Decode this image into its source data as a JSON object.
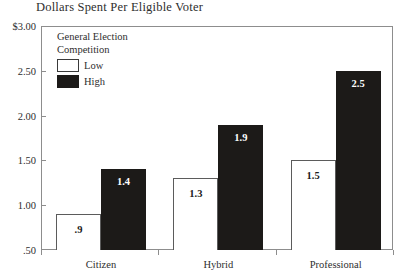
{
  "chart_data": {
    "type": "bar",
    "title": "Dollars Spent Per Eligible Voter",
    "xlabel": "",
    "ylabel": "",
    "categories": [
      "Citizen",
      "Hybrid",
      "Professional"
    ],
    "series": [
      {
        "name": "Low",
        "values": [
          0.9,
          1.3,
          1.5
        ],
        "labels": [
          ".9",
          "1.3",
          "1.5"
        ],
        "color": "#ffffff"
      },
      {
        "name": "High",
        "values": [
          1.4,
          1.9,
          2.5
        ],
        "labels": [
          "1.4",
          "1.9",
          "2.5"
        ],
        "color": "#1c1a18"
      }
    ],
    "ylim": [
      0.5,
      3.0
    ],
    "yticks": [
      0.5,
      1.0,
      1.5,
      2.0,
      2.5,
      3.0
    ],
    "ytick_labels": [
      ".50",
      "1.00",
      "1.50",
      "2.00",
      "2.50",
      "$3.00"
    ],
    "grid": false,
    "legend": {
      "position": "inside-top-left",
      "title_lines": [
        "General Election",
        "Competition"
      ],
      "entries": [
        {
          "label": "Low",
          "swatch": "white-outline"
        },
        {
          "label": "High",
          "swatch": "black-filled"
        }
      ]
    },
    "axis_color": "#8d8d8d",
    "text_color": "#2e2e2e"
  }
}
